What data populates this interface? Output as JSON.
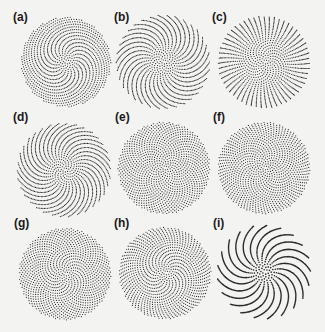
{
  "figure": {
    "background": "#f3f3f1",
    "dot_color": "#2a2a2a",
    "panels": [
      {
        "label": "(a)",
        "lx": 13,
        "ly": 10,
        "cx": 66,
        "cy": 62,
        "r": 45,
        "n": 1100,
        "angle": 137.3,
        "dot": 0.95
      },
      {
        "label": "(b)",
        "lx": 114,
        "ly": 10,
        "cx": 163,
        "cy": 62,
        "r": 47,
        "n": 1150,
        "angle": 137.6,
        "dot": 0.95
      },
      {
        "label": "(c)",
        "lx": 212,
        "ly": 10,
        "cx": 264,
        "cy": 62,
        "r": 46,
        "n": 1100,
        "angle": 137.45,
        "dot": 0.95
      },
      {
        "label": "(d)",
        "lx": 13,
        "ly": 110,
        "cx": 64,
        "cy": 170,
        "r": 47,
        "n": 1200,
        "angle": 137.7,
        "dot": 0.95
      },
      {
        "label": "(e)",
        "lx": 115,
        "ly": 110,
        "cx": 164,
        "cy": 168,
        "r": 46,
        "n": 1150,
        "angle": 137.508,
        "dot": 0.95
      },
      {
        "label": "(f)",
        "lx": 213,
        "ly": 110,
        "cx": 264,
        "cy": 168,
        "r": 46,
        "n": 1150,
        "angle": 137.52,
        "dot": 0.95
      },
      {
        "label": "(g)",
        "lx": 14,
        "ly": 216,
        "cx": 65,
        "cy": 274,
        "r": 46,
        "n": 1150,
        "angle": 137.4,
        "dot": 0.95
      },
      {
        "label": "(h)",
        "lx": 114,
        "ly": 216,
        "cx": 165,
        "cy": 273,
        "r": 46,
        "n": 1150,
        "angle": 137.35,
        "dot": 0.95
      },
      {
        "label": "(i)",
        "lx": 213,
        "ly": 216,
        "cx": 264,
        "cy": 272,
        "r": 47,
        "n": 900,
        "angle": 137.2,
        "dot": 1.3
      }
    ]
  }
}
